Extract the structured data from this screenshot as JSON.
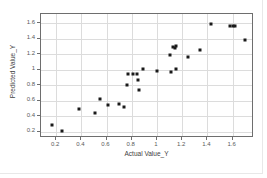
{
  "chart_data": {
    "type": "scatter",
    "title": "",
    "xlabel": "Actual Value_Y",
    "ylabel": "Predicted Value_Y",
    "xlim": [
      0.08,
      1.77
    ],
    "ylim": [
      0.12,
      1.72
    ],
    "xticks": [
      0.2,
      0.4,
      0.6,
      0.8,
      1,
      1.2,
      1.4,
      1.6
    ],
    "yticks": [
      0.2,
      0.4,
      0.6,
      0.8,
      1,
      1.2,
      1.4,
      1.6
    ],
    "xticklabels": [
      "0.2",
      "0.4",
      "0.6",
      "0.8",
      "1",
      "1.2",
      "1.4",
      "1.6"
    ],
    "yticklabels": [
      "0.2",
      "0.4",
      "0.6",
      "0.8",
      "1",
      "1.2",
      "1.4",
      "1.6"
    ],
    "grid": true,
    "legend": false,
    "marker_color": "#1a1a1a",
    "grid_color": "#dcdcdc",
    "frame_color": "#6e6e6e",
    "series": [
      {
        "name": "Predicted vs Actual",
        "x": [
          0.17,
          0.25,
          0.38,
          0.51,
          0.55,
          0.61,
          0.7,
          0.74,
          0.76,
          0.77,
          0.81,
          0.84,
          0.85,
          0.86,
          0.89,
          1.0,
          1.1,
          1.11,
          1.13,
          1.14,
          1.15,
          1.15,
          1.25,
          1.34,
          1.43,
          1.58,
          1.6,
          1.62,
          1.7
        ],
        "y": [
          0.29,
          0.21,
          0.49,
          0.44,
          0.62,
          0.54,
          0.56,
          0.52,
          0.8,
          0.94,
          0.94,
          0.94,
          0.87,
          0.74,
          1.01,
          0.99,
          1.19,
          0.97,
          1.3,
          1.28,
          1.31,
          1.01,
          1.16,
          1.26,
          1.59,
          1.57,
          1.57,
          1.57,
          1.39
        ]
      }
    ]
  }
}
